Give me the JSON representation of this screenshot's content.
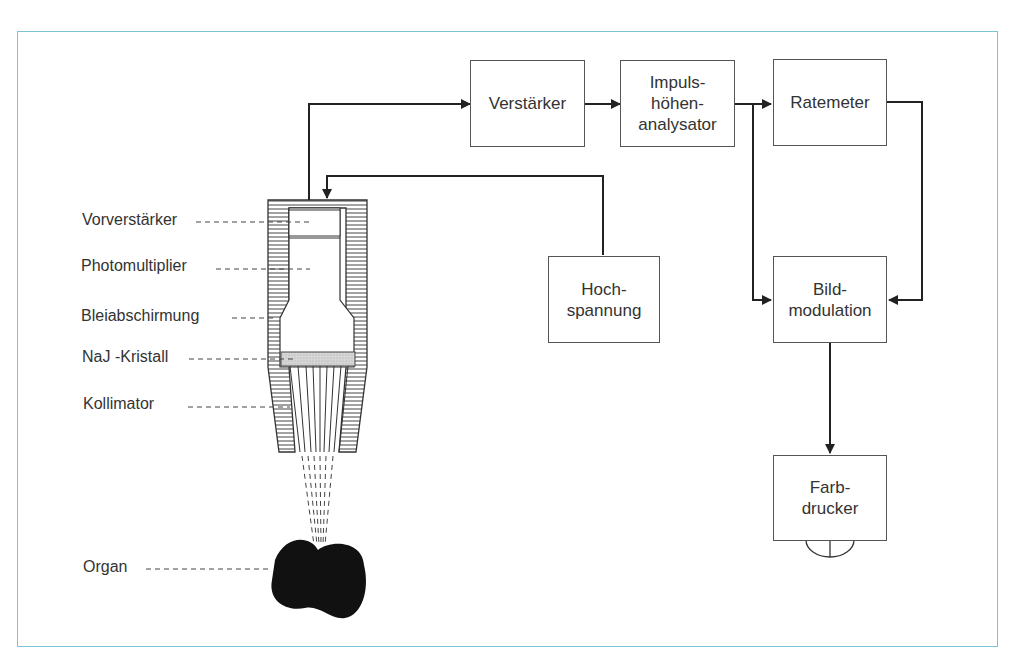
{
  "diagram": {
    "frame_color": "#7fc3d9",
    "line_color": "#222222",
    "blocks": {
      "amplifier": {
        "lines": [
          "Verstärker"
        ]
      },
      "pulse_height_analyzer": {
        "lines": [
          "Impuls-",
          "höhen-",
          "analysator"
        ]
      },
      "ratemeter": {
        "lines": [
          "Ratemeter"
        ]
      },
      "high_voltage": {
        "lines": [
          "Hoch-",
          "spannung"
        ]
      },
      "image_modulation": {
        "lines": [
          "Bild-",
          "modulation"
        ]
      },
      "color_printer": {
        "lines": [
          "Farb-",
          "drucker"
        ]
      }
    },
    "detector_labels": [
      {
        "id": "preamp",
        "label": "Vorverstärker"
      },
      {
        "id": "photomultiplier",
        "label": "Photomultiplier"
      },
      {
        "id": "lead_shield",
        "label": "Bleiabschirmung"
      },
      {
        "id": "crystal",
        "label": "NaJ -Kristall"
      },
      {
        "id": "collimator",
        "label": "Kollimator"
      },
      {
        "id": "organ",
        "label": "Organ"
      }
    ],
    "connections": [
      {
        "from": "detector",
        "to": "Verstärker"
      },
      {
        "from": "Verstärker",
        "to": "Impulshöhenanalysator"
      },
      {
        "from": "Impulshöhenanalysator",
        "to": "Ratemeter"
      },
      {
        "from": "Impulshöhenanalysator",
        "to": "Bildmodulation"
      },
      {
        "from": "Ratemeter",
        "to": "Bildmodulation"
      },
      {
        "from": "Hochspannung",
        "to": "detector"
      },
      {
        "from": "Bildmodulation",
        "to": "Farbdrucker"
      }
    ]
  }
}
